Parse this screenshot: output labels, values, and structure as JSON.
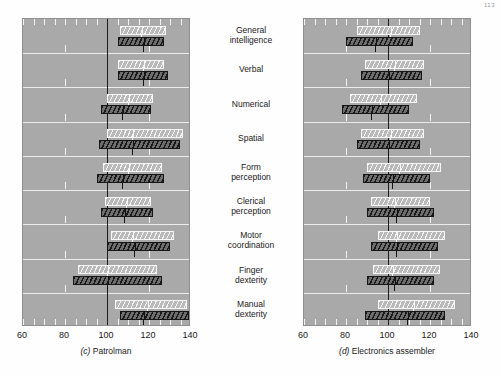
{
  "page_number": "113",
  "categories": [
    "General\nintelligence",
    "Verbal",
    "Numerical",
    "Spatial",
    "Form\nperception",
    "Clerical\nperception",
    "Motor\ncoordination",
    "Finger\ndexterity",
    "Manual\ndexterity"
  ],
  "axis": {
    "ticks": [
      60,
      80,
      100,
      120,
      140
    ],
    "tick_labels": [
      "60",
      "80",
      "100",
      "120",
      "140"
    ],
    "min": 60,
    "max": 140,
    "minor_tick_step": 5,
    "reference_line": 100
  },
  "colors": {
    "plot_background": "#a9a9a9",
    "gridline": "#f2f2f2",
    "reference_line": "#1c1c1c",
    "light_bar_outline": "#f7f7f7",
    "dark_bar_outline": "#161616",
    "page_background": "#fefefe",
    "text": "#1a1a1a"
  },
  "chart_data": {
    "type": "bar",
    "title": "",
    "xlabel": "",
    "ylabel": "",
    "xlim": [
      60,
      140
    ],
    "grid": true,
    "legend": "none",
    "orientation": "horizontal",
    "note": "Paired horizontal range bars (light = upper series, dark = lower series) with a median tick inside each bar; vertical reference line at 100.",
    "panels": [
      {
        "key": "c",
        "label_prefix": "(c)",
        "caption": "Patrolman",
        "caption_full": "(c)  Patrolman",
        "categories": [
          "General intelligence",
          "Verbal",
          "Numerical",
          "Spatial",
          "Form perception",
          "Clerical perception",
          "Motor coordination",
          "Finger dexterity",
          "Manual dexterity"
        ],
        "series": [
          {
            "name": "light",
            "bars": [
              {
                "category": "General intelligence",
                "low": 106,
                "high": 128,
                "median": 116
              },
              {
                "category": "Verbal",
                "low": 105,
                "high": 127,
                "median": 117
              },
              {
                "category": "Numerical",
                "low": 100,
                "high": 122,
                "median": 110
              },
              {
                "category": "Spatial",
                "low": 100,
                "high": 136,
                "median": 112
              },
              {
                "category": "Form perception",
                "low": 98,
                "high": 126,
                "median": 110
              },
              {
                "category": "Clerical perception",
                "low": 99,
                "high": 121,
                "median": 109
              },
              {
                "category": "Motor coordination",
                "low": 102,
                "high": 132,
                "median": 112
              },
              {
                "category": "Finger dexterity",
                "low": 86,
                "high": 124,
                "median": 100
              },
              {
                "category": "Manual dexterity",
                "low": 104,
                "high": 138,
                "median": 119
              }
            ]
          },
          {
            "name": "dark",
            "bars": [
              {
                "category": "General intelligence",
                "low": 105,
                "high": 127,
                "median": 117
              },
              {
                "category": "Verbal",
                "low": 105,
                "high": 129,
                "median": 117
              },
              {
                "category": "Numerical",
                "low": 97,
                "high": 121,
                "median": 107
              },
              {
                "category": "Spatial",
                "low": 96,
                "high": 135,
                "median": 112
              },
              {
                "category": "Form perception",
                "low": 95,
                "high": 127,
                "median": 107
              },
              {
                "category": "Clerical perception",
                "low": 97,
                "high": 122,
                "median": 108
              },
              {
                "category": "Motor coordination",
                "low": 100,
                "high": 130,
                "median": 113
              },
              {
                "category": "Finger dexterity",
                "low": 84,
                "high": 126,
                "median": 100
              },
              {
                "category": "Manual dexterity",
                "low": 106,
                "high": 139,
                "median": 117
              }
            ]
          }
        ]
      },
      {
        "key": "d",
        "label_prefix": "(d)",
        "caption": "Electronics assembler",
        "caption_full": "(d)  Electronics assembler",
        "categories": [
          "General intelligence",
          "Verbal",
          "Numerical",
          "Spatial",
          "Form perception",
          "Clerical perception",
          "Motor coordination",
          "Finger dexterity",
          "Manual dexterity"
        ],
        "series": [
          {
            "name": "light",
            "bars": [
              {
                "category": "General intelligence",
                "low": 85,
                "high": 115,
                "median": 101
              },
              {
                "category": "Verbal",
                "low": 89,
                "high": 117,
                "median": 103
              },
              {
                "category": "Numerical",
                "low": 82,
                "high": 114,
                "median": 96
              },
              {
                "category": "Spatial",
                "low": 87,
                "high": 117,
                "median": 101
              },
              {
                "category": "Form perception",
                "low": 90,
                "high": 125,
                "median": 105
              },
              {
                "category": "Clerical perception",
                "low": 92,
                "high": 120,
                "median": 103
              },
              {
                "category": "Motor coordination",
                "low": 95,
                "high": 127,
                "median": 104
              },
              {
                "category": "Finger dexterity",
                "low": 93,
                "high": 125,
                "median": 102
              },
              {
                "category": "Manual dexterity",
                "low": 95,
                "high": 132,
                "median": 112
              }
            ]
          },
          {
            "name": "dark",
            "bars": [
              {
                "category": "General intelligence",
                "low": 80,
                "high": 112,
                "median": 94
              },
              {
                "category": "Verbal",
                "low": 87,
                "high": 116,
                "median": 100
              },
              {
                "category": "Numerical",
                "low": 78,
                "high": 110,
                "median": 92
              },
              {
                "category": "Spatial",
                "low": 85,
                "high": 115,
                "median": 100
              },
              {
                "category": "Form perception",
                "low": 88,
                "high": 120,
                "median": 102
              },
              {
                "category": "Clerical perception",
                "low": 90,
                "high": 122,
                "median": 104
              },
              {
                "category": "Motor coordination",
                "low": 92,
                "high": 124,
                "median": 104
              },
              {
                "category": "Finger dexterity",
                "low": 90,
                "high": 122,
                "median": 103
              },
              {
                "category": "Manual dexterity",
                "low": 89,
                "high": 127,
                "median": 109
              }
            ]
          }
        ]
      }
    ]
  }
}
